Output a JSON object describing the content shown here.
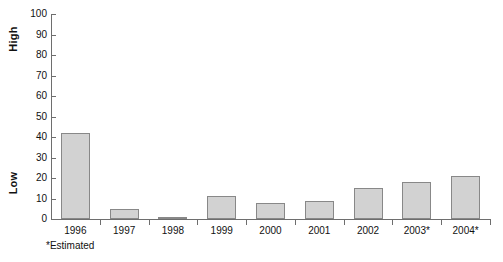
{
  "chart_data": {
    "type": "bar",
    "title": "",
    "subtitle": "",
    "xlabel": "",
    "ylabel": "",
    "categories": [
      "1996",
      "1997",
      "1998",
      "1999",
      "2000",
      "2001",
      "2002",
      "2003*",
      "2004*"
    ],
    "values": [
      42,
      5,
      1,
      11,
      8,
      9,
      15,
      18,
      21
    ],
    "ylim": [
      0,
      100
    ],
    "ytick_step": 10,
    "yticks": [
      "100",
      "90",
      "80",
      "70",
      "60",
      "50",
      "40",
      "30",
      "20",
      "10",
      "0"
    ],
    "grid": false,
    "legend": null,
    "axis_captions": {
      "top": "High",
      "bottom": "Low"
    },
    "annotations": [
      "*Estimated"
    ],
    "series": [
      {
        "name": "value",
        "values": [
          42,
          5,
          1,
          11,
          8,
          9,
          15,
          18,
          21
        ]
      }
    ],
    "colors": {
      "bar_fill": "#d2d2d2",
      "bar_border": "#888888",
      "axis": "#6e6e6e",
      "text": "#111111",
      "background": "#ffffff"
    }
  },
  "footnote": "*Estimated"
}
